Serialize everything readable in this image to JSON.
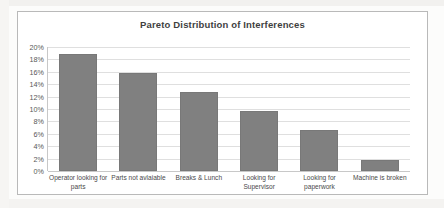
{
  "chart_data": {
    "type": "bar",
    "title": "Pareto Distribution of Interferences",
    "xlabel": "",
    "ylabel": "",
    "categories": [
      "Operator looking for parts",
      "Parts not avlaiable",
      "Breaks & Lunch",
      "Looking for Supervisor",
      "Looking for paperwork",
      "Machine is broken"
    ],
    "values": [
      18.8,
      15.8,
      12.7,
      9.7,
      6.6,
      1.8
    ],
    "ylim": [
      0,
      20
    ],
    "ytick_labels": [
      "20%",
      "18%",
      "16%",
      "14%",
      "12%",
      "10%",
      "8%",
      "6%",
      "4%",
      "2%",
      "0%"
    ],
    "ytick_values": [
      20,
      18,
      16,
      14,
      12,
      10,
      8,
      6,
      4,
      2,
      0
    ],
    "grid": true,
    "legend": false,
    "bar_color": "#808080",
    "gridline_color": "#dfdfdf",
    "axis_color": "#c8c8c8",
    "frame_color": "#b9b9b9",
    "title_color": "#3f3f3f",
    "plot_background": "#ffffff"
  }
}
